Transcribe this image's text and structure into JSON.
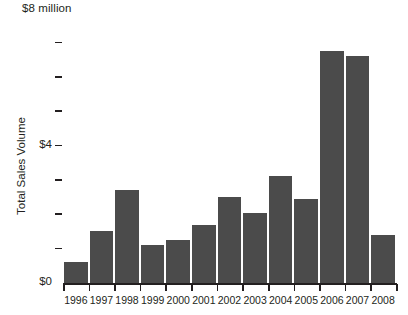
{
  "chart_data": {
    "type": "bar",
    "title": "",
    "unit_caption": "$8 million",
    "xlabel": "",
    "ylabel": "Total Sales Volume",
    "categories": [
      "1996",
      "1997",
      "1998",
      "1999",
      "2000",
      "2001",
      "2002",
      "2003",
      "2004",
      "2005",
      "2006",
      "2007",
      "2008"
    ],
    "values": [
      0.6,
      1.5,
      2.7,
      1.1,
      1.25,
      1.7,
      2.5,
      2.05,
      3.1,
      2.45,
      6.75,
      6.6,
      1.4
    ],
    "ylim": [
      0,
      8
    ],
    "y_tick_values": [
      0,
      1,
      2,
      3,
      4,
      5,
      6,
      7,
      8
    ],
    "y_labeled_ticks": [
      {
        "value": 0,
        "label": "$0"
      },
      {
        "value": 4,
        "label": "$4"
      },
      {
        "value": 8,
        "label": "$8 million"
      }
    ],
    "grid": false,
    "legend": null,
    "bar_color": "#4b4b4b",
    "axis_color": "#231f20",
    "background_color": "#ffffff"
  }
}
